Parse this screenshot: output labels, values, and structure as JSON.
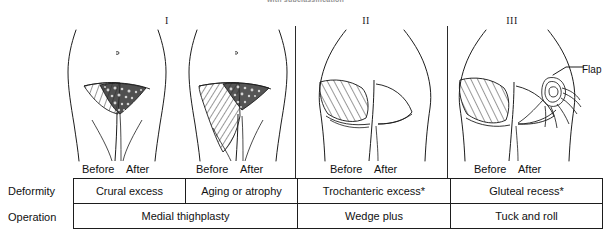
{
  "figure": {
    "top_caption": "with subclassification"
  },
  "columns": [
    {
      "numeral": "I"
    },
    {
      "numeral": "II"
    },
    {
      "numeral": "III"
    }
  ],
  "panels": [
    {
      "id": "crural",
      "view": "anterior-medial-thigh",
      "before_label": "Before",
      "after_label": "After",
      "shading": "stipple-and-hatch"
    },
    {
      "id": "aging",
      "view": "anterior-medial-thigh",
      "before_label": "Before",
      "after_label": "After",
      "shading": "stipple-and-hatch"
    },
    {
      "id": "trochanteric",
      "view": "posterior-buttock",
      "before_label": "Before",
      "after_label": "After",
      "shading": "hatch"
    },
    {
      "id": "gluteal",
      "view": "posterior-buttock",
      "before_label": "Before",
      "after_label": "After",
      "shading": "hatch",
      "callout": "Flap"
    }
  ],
  "table": {
    "row_labels": {
      "deformity": "Deformity",
      "operation": "Operation"
    },
    "deformity_cells": [
      "Crural excess",
      "Aging or atrophy",
      "Trochanteric excess*",
      "Gluteal recess*"
    ],
    "operation_cells": [
      "Medial thighplasty",
      "Wedge plus",
      "Tuck and roll"
    ]
  },
  "colors": {
    "ink": "#1d1d1d",
    "paper": "#ffffff"
  }
}
